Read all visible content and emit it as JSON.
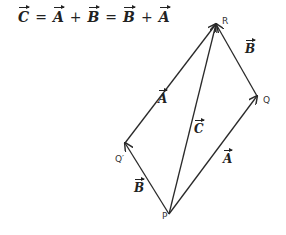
{
  "equation": {
    "c": "C",
    "eq1": "=",
    "a1": "A",
    "plus1": "+",
    "b1": "B",
    "eq2": "=",
    "b2": "B",
    "plus2": "+",
    "a2": "A"
  },
  "points": {
    "P": {
      "label": "P",
      "x": 169,
      "y": 214
    },
    "Q": {
      "label": "Q",
      "x": 257,
      "y": 96
    },
    "R": {
      "label": "R",
      "x": 216,
      "y": 24
    },
    "Q_prime": {
      "label": "Q′",
      "x": 125,
      "y": 143
    }
  },
  "vector_labels": {
    "a_upper": "A",
    "b_right": "B",
    "c_middle": "C",
    "a_lower": "A",
    "b_lower": "B"
  },
  "colors": {
    "line": "#2a2a2a",
    "text": "#222222"
  }
}
